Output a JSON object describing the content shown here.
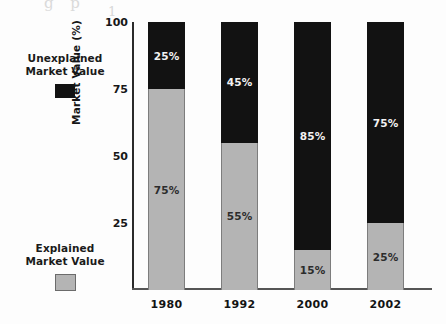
{
  "figure": {
    "background": "#ffffff",
    "scan_artifact_top": "g p",
    "scan_artifact_top2": "1"
  },
  "legend": {
    "items": [
      {
        "id": "unexplained",
        "line1": "Unexplained",
        "line2": "Market Value",
        "swatch_color": "#121212",
        "swatch_kind": "dark"
      },
      {
        "id": "explained",
        "line1": "Explained",
        "line2": "Market Value",
        "swatch_color": "#b4b4b4",
        "swatch_kind": "light"
      }
    ]
  },
  "axes": {
    "y_title": "Market Value (%)",
    "y_ticks": [
      "100",
      "75",
      "50",
      "25"
    ],
    "x_ticks": [
      "1980",
      "1992",
      "2000",
      "2002"
    ]
  },
  "chart_data": {
    "type": "bar",
    "subtype": "stacked-100-percent",
    "title": "",
    "xlabel": "",
    "ylabel": "Market Value (%)",
    "ylim": [
      0,
      100
    ],
    "yticks": [
      25,
      50,
      75,
      100
    ],
    "grid": false,
    "legend_position": "left",
    "categories": [
      "1980",
      "1992",
      "2000",
      "2002"
    ],
    "series": [
      {
        "name": "Explained Market Value",
        "color": "#b4b4b4",
        "values": [
          75,
          55,
          15,
          25
        ],
        "labels": [
          "75%",
          "55%",
          "15%",
          "25%"
        ]
      },
      {
        "name": "Unexplained Market Value",
        "color": "#121212",
        "values": [
          25,
          45,
          85,
          75
        ],
        "labels": [
          "25%",
          "45%",
          "85%",
          "75%"
        ]
      }
    ]
  }
}
